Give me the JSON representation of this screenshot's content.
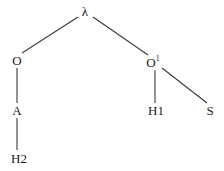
{
  "figure": {
    "kind": "tree-diagram",
    "width": 224,
    "height": 171,
    "background_color": "#ffffff",
    "line_color": "#3a3a3a",
    "text_color": "#1a1a1a"
  },
  "nodes": [
    {
      "id": "root",
      "label": "λ",
      "sup": "",
      "x": 85,
      "y": 11
    },
    {
      "id": "o",
      "label": "O",
      "sup": "",
      "x": 17,
      "y": 60
    },
    {
      "id": "o1",
      "label": "O",
      "sup": "1",
      "x": 153,
      "y": 62
    },
    {
      "id": "a",
      "label": "A",
      "sup": "",
      "x": 17,
      "y": 110
    },
    {
      "id": "h1",
      "label": "H1",
      "sup": "",
      "x": 156,
      "y": 110
    },
    {
      "id": "s",
      "label": "S",
      "sup": "",
      "x": 210,
      "y": 110
    },
    {
      "id": "h2",
      "label": "H2",
      "sup": "",
      "x": 19,
      "y": 158
    }
  ],
  "edges": [
    {
      "id": "root-o",
      "from": "root",
      "to": "o",
      "x1": 78,
      "y1": 17,
      "x2": 22,
      "y2": 53
    },
    {
      "id": "root-o1",
      "from": "root",
      "to": "o1",
      "x1": 93,
      "y1": 17,
      "x2": 148,
      "y2": 55
    },
    {
      "id": "o-a",
      "from": "o",
      "to": "a",
      "x1": 17,
      "y1": 68,
      "x2": 17,
      "y2": 103
    },
    {
      "id": "a-h2",
      "from": "a",
      "to": "h2",
      "x1": 17,
      "y1": 118,
      "x2": 17,
      "y2": 150
    },
    {
      "id": "o1-h1",
      "from": "o1",
      "to": "h1",
      "x1": 155,
      "y1": 70,
      "x2": 155,
      "y2": 103
    },
    {
      "id": "o1-s",
      "from": "o1",
      "to": "s",
      "x1": 162,
      "y1": 68,
      "x2": 207,
      "y2": 103
    }
  ]
}
